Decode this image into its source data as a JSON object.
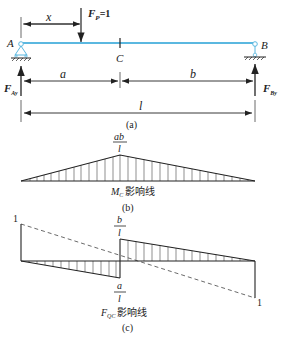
{
  "figure_a": {
    "load_label": "F",
    "load_sub": "P",
    "load_value": "=1",
    "dim_x": "x",
    "point_a": "A",
    "point_b": "B",
    "point_c": "C",
    "reaction_a": "F",
    "reaction_a_sub": "Ay",
    "reaction_b": "F",
    "reaction_b_sub": "By",
    "dim_a": "a",
    "dim_b": "b",
    "dim_l": "l",
    "caption": "(a)",
    "beam_color": "#5bb8e0"
  },
  "figure_b": {
    "peak_num": "ab",
    "peak_den": "l",
    "title_var": "M",
    "title_sub": "C",
    "title_text": "影响线",
    "caption": "(b)"
  },
  "figure_c": {
    "left_value": "1",
    "right_value": "1",
    "pos_num": "b",
    "pos_den": "l",
    "neg_num": "a",
    "neg_den": "l",
    "title_var": "F",
    "title_sub": "QC",
    "title_text": "影响线",
    "caption": "(c)"
  }
}
